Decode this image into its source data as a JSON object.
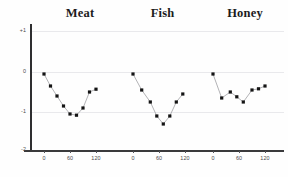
{
  "figure": {
    "background_color": "#fefefe",
    "axis_color": "#2e2e30",
    "grid_color": "#e9e9ec",
    "marker_color": "#141414",
    "line_color": "#9a9a9e"
  },
  "chart_data": {
    "type": "line",
    "title": "",
    "xlabel": "",
    "ylabel": "",
    "xlim": [
      -15,
      140
    ],
    "ylim": [
      -2,
      1
    ],
    "grid": true,
    "legend": "none",
    "shared_y_axis": true,
    "y_ticks": [
      {
        "value": 1,
        "label": "+1"
      },
      {
        "value": 0,
        "label": "0"
      },
      {
        "value": -1,
        "label": "-1"
      },
      {
        "value": -2,
        "label": "-2"
      }
    ],
    "x_ticks": [
      {
        "value": 0,
        "label": "0"
      },
      {
        "value": 60,
        "label": "60"
      },
      {
        "value": 120,
        "label": "120"
      }
    ],
    "panels": [
      {
        "name": "Meat",
        "title": "Meat",
        "x": [
          0,
          15,
          30,
          45,
          60,
          75,
          90,
          105,
          120
        ],
        "y": [
          -0.05,
          -0.35,
          -0.6,
          -0.85,
          -1.05,
          -1.08,
          -0.9,
          -0.5,
          -0.43
        ]
      },
      {
        "name": "Fish",
        "title": "Fish",
        "x": [
          0,
          20,
          40,
          55,
          70,
          85,
          100,
          115
        ],
        "y": [
          -0.05,
          -0.45,
          -0.75,
          -1.1,
          -1.3,
          -1.1,
          -0.75,
          -0.55
        ]
      },
      {
        "name": "Honey",
        "title": "Honey",
        "x": [
          0,
          20,
          40,
          55,
          70,
          90,
          105,
          120
        ],
        "y": [
          -0.05,
          -0.65,
          -0.5,
          -0.62,
          -0.75,
          -0.45,
          -0.42,
          -0.35
        ]
      }
    ]
  }
}
